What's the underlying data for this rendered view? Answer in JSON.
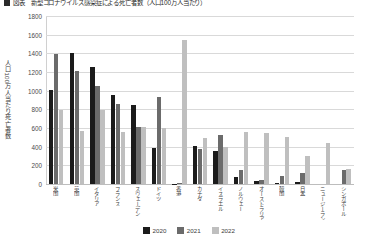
{
  "title": {
    "marker_icon": "square-bullet-icon",
    "text": "図表　新型コロナウイルス感染症による死亡者数（人口100万人当たり）"
  },
  "legend": {
    "position": "bottom-center",
    "items": [
      {
        "label": "2020",
        "color": "#1b1b1b"
      },
      {
        "label": "2021",
        "color": "#6b6b6b"
      },
      {
        "label": "2022",
        "color": "#bfbfbf"
      }
    ]
  },
  "axes": {
    "ylabel": "人口100万人当たり死亡者数",
    "yticks": [
      "0",
      "200",
      "400",
      "600",
      "800",
      "1000",
      "1200",
      "1400",
      "1600",
      "1800"
    ],
    "ymin": 0,
    "ymax": 1800,
    "xlabel": ""
  },
  "chart_data": {
    "type": "bar",
    "title": "図表　新型コロナウイルス感染症による死亡者数（人口100万人当たり）",
    "xlabel": "",
    "ylabel": "人口100万人当たり死亡者数",
    "ylim": [
      0,
      1800
    ],
    "ytick_step": 200,
    "grid": true,
    "legend_position": "bottom-center",
    "categories": [
      "米国",
      "英国",
      "イタリア",
      "フランス",
      "スウェーデン",
      "ドイツ",
      "香港",
      "カナダ",
      "イスラエル",
      "ノルウェー",
      "オーストラリア",
      "韓国",
      "日本",
      "ニュージーランド",
      "シンガポール"
    ],
    "series": [
      {
        "name": "2020",
        "color": "#1b1b1b",
        "values": [
          1010,
          1400,
          1250,
          955,
          850,
          390,
          5,
          410,
          350,
          80,
          35,
          10,
          25,
          0,
          0
        ]
      },
      {
        "name": "2021",
        "color": "#6b6b6b",
        "values": [
          1390,
          1215,
          1055,
          860,
          615,
          935,
          8,
          380,
          525,
          155,
          40,
          90,
          120,
          0,
          145
        ]
      },
      {
        "name": "2022",
        "color": "#bfbfbf",
        "values": [
          795,
          565,
          795,
          555,
          615,
          595,
          1540,
          490,
          400,
          555,
          550,
          505,
          305,
          435,
          160
        ]
      }
    ]
  }
}
